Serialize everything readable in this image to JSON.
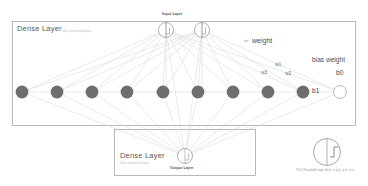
{
  "figure": {
    "type": "neural-network-diagram",
    "background": "#ffffff",
    "node_fill": "#6e6e6e",
    "edge_color": "#c9c9c9",
    "box_border": "#9a9a9a"
  },
  "input_layer": {
    "caption": "Input Layer",
    "node_count": 2,
    "node_style": "split-circle"
  },
  "hidden_layer": {
    "box_title": "Dense Layer",
    "box_subtitle": "fully connected layer",
    "node_count": 9,
    "node_style": "filled-circle",
    "bias_node_value": "1"
  },
  "output_layer": {
    "box_title": "Dense Layer",
    "box_subtitle": "fully connected layer",
    "caption": "Output Layer",
    "node_symbol": "Σ",
    "node_style": "split-circle"
  },
  "annotations": {
    "weight_label": "weight",
    "weight_n": "wn",
    "w1": "w1",
    "w2": "w2",
    "w3": "w3",
    "bias_weight_label": "bias weight",
    "b0": "b0",
    "b1": "b1"
  },
  "tlu_legend": {
    "sum_symbol": "Σ",
    "caption": "TLU (Threshold Logic Unit) 임계값 논리 유닛",
    "glyph": "step-function"
  }
}
